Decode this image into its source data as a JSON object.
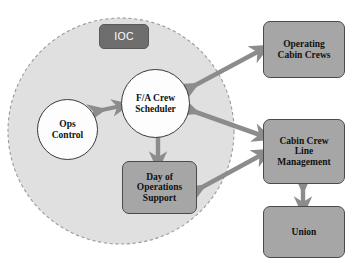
{
  "diagram": {
    "colors": {
      "boundary_fill": "#e0e0e0",
      "boundary_stroke": "#9a9a9a",
      "box_fill": "#a6a6a6",
      "box_stroke": "#4a4a4a",
      "tag_fill": "#6e6e6e",
      "circle_fill": "#fdfdfd",
      "circle_stroke": "#3a3a3a",
      "arrow": "#8c8c8c",
      "text_dark": "#111111",
      "text_light": "#ffffff",
      "background": "#ffffff"
    },
    "boundary": {
      "name": "IOC boundary",
      "shape": "dashed-circle",
      "label": "IOC"
    },
    "nodes": [
      {
        "id": "ioc",
        "label": "IOC",
        "shape": "rounded-rect",
        "style": "dark-tag",
        "inside_boundary": true
      },
      {
        "id": "fa_scheduler",
        "label": "F/A Crew\nScheduler",
        "shape": "circle",
        "style": "white-circle",
        "inside_boundary": true
      },
      {
        "id": "ops_control",
        "label": "Ops\nControl",
        "shape": "circle",
        "style": "white-circle",
        "inside_boundary": true
      },
      {
        "id": "day_of_ops",
        "label": "Day of\nOperations\nSupport",
        "shape": "rounded-rect",
        "style": "gray-box",
        "inside_boundary": true
      },
      {
        "id": "operating_crews",
        "label": "Operating\nCabin Crews",
        "shape": "rounded-rect",
        "style": "gray-box",
        "inside_boundary": false
      },
      {
        "id": "cclm",
        "label": "Cabin Crew\nLine\nManagement",
        "shape": "rounded-rect",
        "style": "gray-box",
        "inside_boundary": false
      },
      {
        "id": "union",
        "label": "Union",
        "shape": "rounded-rect",
        "style": "gray-box",
        "inside_boundary": false
      }
    ],
    "connections": [
      {
        "id": "c1",
        "from": "ops_control",
        "to": "fa_scheduler",
        "arrow": "double",
        "orientation": "horizontal"
      },
      {
        "id": "c2",
        "from": "fa_scheduler",
        "to": "operating_crews",
        "arrow": "double",
        "orientation": "diagonal-up-right"
      },
      {
        "id": "c3",
        "from": "fa_scheduler",
        "to": "cclm",
        "arrow": "double",
        "orientation": "diagonal-down-right"
      },
      {
        "id": "c4",
        "from": "fa_scheduler",
        "to": "day_of_ops",
        "arrow": "double",
        "orientation": "vertical"
      },
      {
        "id": "c5",
        "from": "day_of_ops",
        "to": "cclm",
        "arrow": "double",
        "orientation": "diagonal-up-right"
      },
      {
        "id": "c6",
        "from": "cclm",
        "to": "union",
        "arrow": "double",
        "orientation": "vertical"
      }
    ]
  }
}
